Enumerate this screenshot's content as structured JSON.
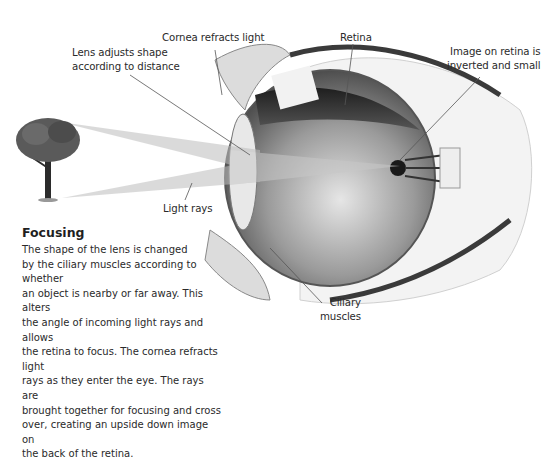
{
  "labels": {
    "lens": "Lens adjusts shape\naccording to distance",
    "cornea": "Cornea refracts light",
    "retina": "Retina",
    "image": "Image on retina is\ninverted and small",
    "light_rays": "Light rays",
    "ciliary": "Ciliary\nmuscles"
  },
  "caption": {
    "title": "Focusing",
    "body": "The shape of the lens is changed\nby the ciliary muscles according to whether\nan object is nearby or far away. This alters\nthe angle of incoming light rays and allows\nthe retina to focus. The cornea refracts light\nrays as they enter the eye. The rays are\nbrought together for focusing and cross\nover, creating an upside down image on\nthe back of the retina."
  },
  "colors": {
    "ray": "#bdbdbd",
    "tree_canopy": "#5a5a5a",
    "eye_dark": "#2b2b2b"
  }
}
